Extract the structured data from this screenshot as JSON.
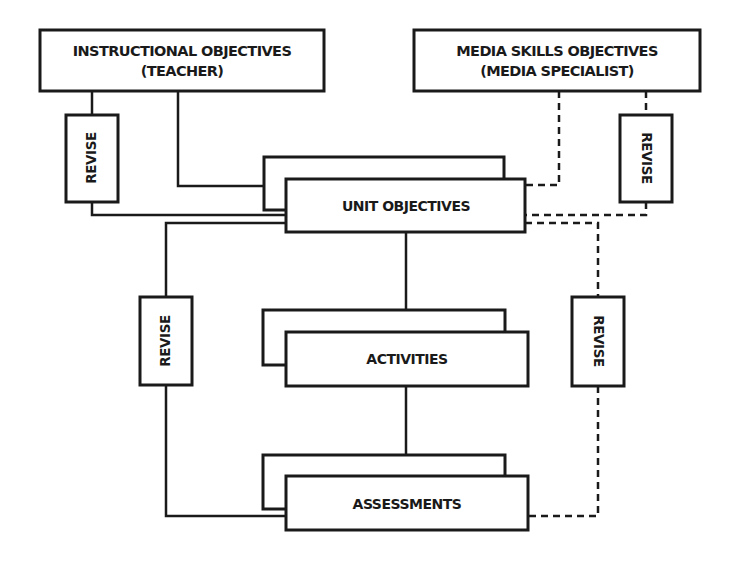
{
  "diagram": {
    "nodes": {
      "instructional": {
        "line1": "INSTRUCTIONAL OBJECTIVES",
        "line2": "(TEACHER)"
      },
      "media": {
        "line1": "MEDIA SKILLS OBJECTIVES",
        "line2": "(MEDIA SPECIALIST)"
      },
      "unit": {
        "label": "UNIT OBJECTIVES"
      },
      "activities": {
        "label": "ACTIVITIES"
      },
      "assessments": {
        "label": "ASSESSMENTS"
      }
    },
    "revise": {
      "top_left": "REVISE",
      "top_right": "REVISE",
      "mid_left": "REVISE",
      "mid_right": "REVISE"
    },
    "colors": {
      "stroke": "#1a1a1a",
      "background": "#ffffff"
    }
  }
}
